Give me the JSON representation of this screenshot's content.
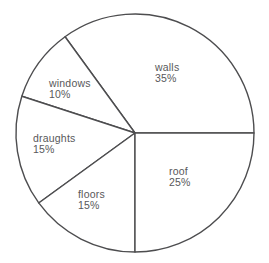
{
  "page": {
    "background_color": "#ffffff"
  },
  "chart_data": {
    "type": "pie",
    "title": "",
    "categories": [
      "walls",
      "windows",
      "draughts",
      "floors",
      "roof"
    ],
    "values": [
      35,
      10,
      15,
      15,
      25
    ],
    "unit": "%",
    "legend": "none",
    "slices": [
      {
        "label": "walls",
        "value": 35,
        "pct_text": "35%",
        "label_x": 155,
        "label_y": 63
      },
      {
        "label": "windows",
        "value": 10,
        "pct_text": "10%",
        "label_x": 49,
        "label_y": 79
      },
      {
        "label": "draughts",
        "value": 15,
        "pct_text": "15%",
        "label_x": 33,
        "label_y": 134
      },
      {
        "label": "floors",
        "value": 15,
        "pct_text": "15%",
        "label_x": 78,
        "label_y": 190
      },
      {
        "label": "roof",
        "value": 25,
        "pct_text": "25%",
        "label_x": 169,
        "label_y": 167
      }
    ],
    "layout": {
      "width": 269,
      "height": 263,
      "center_x": 135,
      "center_y": 133,
      "radius": 119,
      "start_angle_deg": 0,
      "direction": "counterclockwise",
      "slice_fill": "#ffffff",
      "stroke_color": "#4d4d4f",
      "stroke_width": 1.4,
      "text_color": "#58585a",
      "font_size": 10.5,
      "first_line_baseline_offset": 8,
      "line_spacing": 10.5
    }
  }
}
